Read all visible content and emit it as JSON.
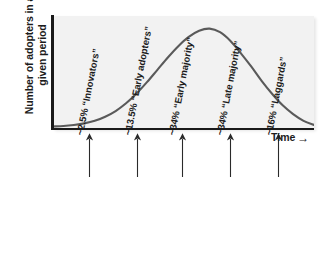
{
  "chart_data": {
    "type": "line",
    "title": "",
    "subtitle": "",
    "ylabel_line1": "Number of adopters in a",
    "ylabel_line2": "given period",
    "xlabel": "Time",
    "xlabel_arrow": "→",
    "grid": false,
    "legend_position": "none",
    "curve_shape": "normal-distribution-bell-curve",
    "curve_color": "#5a5a5a",
    "plot_background": "#f2f2f2",
    "axis_color": "#1a1a1a",
    "xlim": [
      0,
      100
    ],
    "ylim": [
      0,
      100
    ],
    "x": [
      0,
      4,
      8,
      12,
      16,
      20,
      24,
      28,
      32,
      36,
      40,
      44,
      48,
      52,
      56,
      60,
      64,
      68,
      72,
      76,
      80,
      84,
      88,
      92,
      96,
      100
    ],
    "y": [
      1,
      1.5,
      2.5,
      4,
      6.5,
      10.5,
      16,
      23.5,
      33,
      44,
      56,
      68,
      79,
      88,
      94,
      96,
      92.5,
      84,
      72,
      59,
      45,
      32.5,
      21.5,
      13,
      6.5,
      2.5
    ],
    "peak_x": 60,
    "peak_y": 96,
    "annotations": [
      {
        "percent": "~2.5%",
        "group": "“Innovators”",
        "label": "~2.5% “Innovators”",
        "arrow_x_pct": 14.0
      },
      {
        "percent": "~13.5%",
        "group": "“Early adopters”",
        "label": "~13.5% “Early adopters”",
        "arrow_x_pct": 32.5
      },
      {
        "percent": "~34%",
        "group": "“Early majority”",
        "label": "~34% “Early majority”",
        "arrow_x_pct": 49.5
      },
      {
        "percent": "~34%",
        "group": "“Late majority”",
        "label": "~34% “Late majority”",
        "arrow_x_pct": 68.0
      },
      {
        "percent": "~16%",
        "group": "“Laggards”",
        "label": "~16% “Laggards”",
        "arrow_x_pct": 86.5
      }
    ]
  }
}
